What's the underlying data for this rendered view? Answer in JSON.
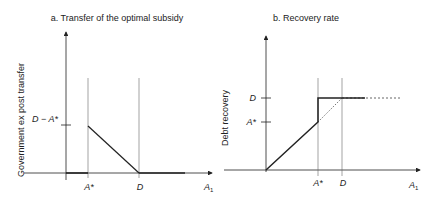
{
  "panel_a": {
    "title": "a. Transfer of the optimal subsidy",
    "ylabel": "Government ex post transfer",
    "ytick_label": "D − A*",
    "xticks": [
      "A*",
      "D"
    ],
    "xlabel": "A",
    "xlabel_sub": "1"
  },
  "panel_b": {
    "title": "b. Recovery rate",
    "ylabel": "Debt recovery",
    "ytick_labels": [
      "D",
      "A*"
    ],
    "xticks": [
      "A*",
      "D"
    ],
    "xlabel": "A",
    "xlabel_sub": "1"
  },
  "colors": {
    "line": "#222222",
    "guide": "#888888",
    "dotted": "#555555"
  }
}
